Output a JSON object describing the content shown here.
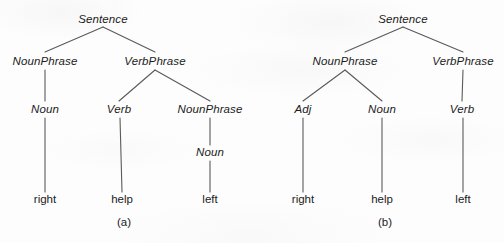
{
  "figure": {
    "background_color": "#fdfdfd",
    "line_color": "#5a5a5e",
    "text_color": "#1b1b1b"
  },
  "panels": [
    {
      "id": "a",
      "caption": "(a)",
      "caption_pos": {
        "x": 124,
        "y": 222
      },
      "nodes": [
        {
          "id": "a-s",
          "label": "Sentence",
          "type": "nonterminal",
          "x": 103,
          "y": 20
        },
        {
          "id": "a-np1",
          "label": "NounPhrase",
          "type": "nonterminal",
          "x": 45,
          "y": 62
        },
        {
          "id": "a-vp",
          "label": "VerbPhrase",
          "type": "nonterminal",
          "x": 155,
          "y": 62
        },
        {
          "id": "a-n1",
          "label": "Noun",
          "type": "nonterminal",
          "x": 45,
          "y": 110
        },
        {
          "id": "a-v",
          "label": "Verb",
          "type": "nonterminal",
          "x": 119,
          "y": 110
        },
        {
          "id": "a-np2",
          "label": "NounPhrase",
          "type": "nonterminal",
          "x": 210,
          "y": 110
        },
        {
          "id": "a-n2",
          "label": "Noun",
          "type": "nonterminal",
          "x": 210,
          "y": 153
        },
        {
          "id": "a-w1",
          "label": "right",
          "type": "terminal",
          "x": 45,
          "y": 200
        },
        {
          "id": "a-w2",
          "label": "help",
          "type": "terminal",
          "x": 122,
          "y": 200
        },
        {
          "id": "a-w3",
          "label": "left",
          "type": "terminal",
          "x": 210,
          "y": 200
        }
      ],
      "edges": [
        {
          "from": "a-s",
          "to": "a-np1",
          "x1": 103,
          "y1": 27,
          "x2": 45,
          "y2": 52
        },
        {
          "from": "a-s",
          "to": "a-vp",
          "x1": 103,
          "y1": 27,
          "x2": 155,
          "y2": 52
        },
        {
          "from": "a-np1",
          "to": "a-n1",
          "x1": 45,
          "y1": 70,
          "x2": 45,
          "y2": 101
        },
        {
          "from": "a-vp",
          "to": "a-v",
          "x1": 155,
          "y1": 70,
          "x2": 119,
          "y2": 101
        },
        {
          "from": "a-vp",
          "to": "a-np2",
          "x1": 155,
          "y1": 70,
          "x2": 210,
          "y2": 101
        },
        {
          "from": "a-np2",
          "to": "a-n2",
          "x1": 210,
          "y1": 118,
          "x2": 210,
          "y2": 145
        },
        {
          "from": "a-n1",
          "to": "a-w1",
          "x1": 45,
          "y1": 118,
          "x2": 45,
          "y2": 192
        },
        {
          "from": "a-v",
          "to": "a-w2",
          "x1": 120,
          "y1": 118,
          "x2": 122,
          "y2": 192
        },
        {
          "from": "a-n2",
          "to": "a-w3",
          "x1": 210,
          "y1": 161,
          "x2": 210,
          "y2": 192
        }
      ]
    },
    {
      "id": "b",
      "caption": "(b)",
      "caption_pos": {
        "x": 385,
        "y": 222
      },
      "nodes": [
        {
          "id": "b-s",
          "label": "Sentence",
          "type": "nonterminal",
          "x": 403,
          "y": 20
        },
        {
          "id": "b-np",
          "label": "NounPhrase",
          "type": "nonterminal",
          "x": 345,
          "y": 62
        },
        {
          "id": "b-vp",
          "label": "VerbPhrase",
          "type": "nonterminal",
          "x": 463,
          "y": 62
        },
        {
          "id": "b-adj",
          "label": "Adj",
          "type": "nonterminal",
          "x": 303,
          "y": 110
        },
        {
          "id": "b-n",
          "label": "Noun",
          "type": "nonterminal",
          "x": 382,
          "y": 110
        },
        {
          "id": "b-v",
          "label": "Verb",
          "type": "nonterminal",
          "x": 462,
          "y": 110
        },
        {
          "id": "b-w1",
          "label": "right",
          "type": "terminal",
          "x": 303,
          "y": 200
        },
        {
          "id": "b-w2",
          "label": "help",
          "type": "terminal",
          "x": 382,
          "y": 200
        },
        {
          "id": "b-w3",
          "label": "left",
          "type": "terminal",
          "x": 463,
          "y": 200
        }
      ],
      "edges": [
        {
          "from": "b-s",
          "to": "b-np",
          "x1": 403,
          "y1": 27,
          "x2": 345,
          "y2": 52
        },
        {
          "from": "b-s",
          "to": "b-vp",
          "x1": 403,
          "y1": 27,
          "x2": 463,
          "y2": 52
        },
        {
          "from": "b-np",
          "to": "b-adj",
          "x1": 345,
          "y1": 70,
          "x2": 303,
          "y2": 101
        },
        {
          "from": "b-np",
          "to": "b-n",
          "x1": 345,
          "y1": 70,
          "x2": 382,
          "y2": 101
        },
        {
          "from": "b-vp",
          "to": "b-v",
          "x1": 463,
          "y1": 70,
          "x2": 462,
          "y2": 101
        },
        {
          "from": "b-adj",
          "to": "b-w1",
          "x1": 303,
          "y1": 118,
          "x2": 303,
          "y2": 192
        },
        {
          "from": "b-n",
          "to": "b-w2",
          "x1": 382,
          "y1": 118,
          "x2": 382,
          "y2": 192
        },
        {
          "from": "b-v",
          "to": "b-w3",
          "x1": 463,
          "y1": 118,
          "x2": 463,
          "y2": 192
        }
      ]
    }
  ],
  "chart_data": {
    "type": "diagram",
    "subtype": "parse-tree-pair",
    "title": "",
    "sentence_words": [
      "right",
      "help",
      "left"
    ],
    "trees": [
      {
        "panel": "a",
        "caption": "(a)",
        "root": "Sentence",
        "structure": "Sentence -> NounPhrase(Noun(right)) VerbPhrase(Verb(help) NounPhrase(Noun(left)))",
        "levels": [
          [
            "Sentence"
          ],
          [
            "NounPhrase",
            "VerbPhrase"
          ],
          [
            "Noun",
            "Verb",
            "NounPhrase"
          ],
          [
            "Noun"
          ],
          [
            "right",
            "help",
            "left"
          ]
        ]
      },
      {
        "panel": "b",
        "caption": "(b)",
        "root": "Sentence",
        "structure": "Sentence -> NounPhrase(Adj(right) Noun(help)) VerbPhrase(Verb(left))",
        "levels": [
          [
            "Sentence"
          ],
          [
            "NounPhrase",
            "VerbPhrase"
          ],
          [
            "Adj",
            "Noun",
            "Verb"
          ],
          [
            "right",
            "help",
            "left"
          ]
        ]
      }
    ]
  }
}
